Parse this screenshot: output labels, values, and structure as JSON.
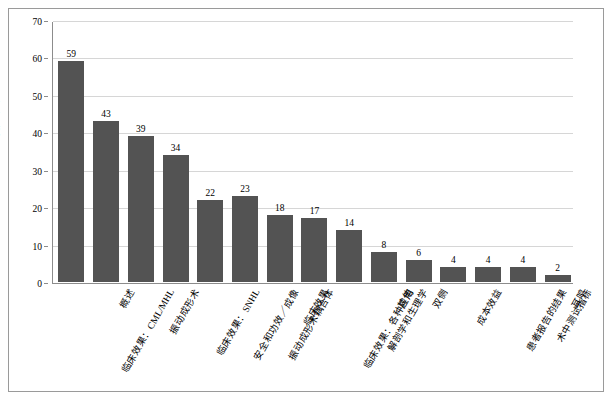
{
  "chart_data": {
    "type": "bar",
    "title": "",
    "xlabel": "",
    "ylabel": "出版物数量",
    "ylim": [
      0,
      70
    ],
    "yticks": [
      0,
      10,
      20,
      30,
      40,
      50,
      60,
      70
    ],
    "grid": true,
    "legend": "none",
    "bar_color": "#535353",
    "categories": [
      "临床效果：CML/MHL",
      "概述",
      "振动成形术",
      "临床效果：SNHL",
      "安全和功效／成像",
      "振动成形术耦合体",
      "临床效果",
      "临床效果：各种应用",
      "解剖学和生理学",
      "其他",
      "双侧",
      "成本效益",
      "患者报告的结果",
      "术中测试指标",
      "耳鸣"
    ],
    "values": [
      59,
      43,
      39,
      34,
      22,
      23,
      18,
      17,
      14,
      8,
      6,
      4,
      4,
      4,
      2
    ]
  }
}
